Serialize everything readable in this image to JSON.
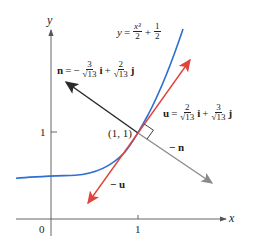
{
  "diagram": {
    "type": "vector-diagram",
    "curve_equation": {
      "lhs": "y",
      "equals": "=",
      "term1_num": "x³",
      "term1_den": "2",
      "plus": "+",
      "term2_num": "1",
      "term2_den": "2"
    },
    "n_label": {
      "name": "n",
      "equals": "=",
      "sign1": "−",
      "c1_num": "3",
      "c1_den": "√13",
      "unit1": "i",
      "plus": "+",
      "c2_num": "2",
      "c2_den": "√13",
      "unit2": "j"
    },
    "u_label": {
      "name": "u",
      "equals": "=",
      "c1_num": "2",
      "c1_den": "√13",
      "unit1": "i",
      "plus": "+",
      "c2_num": "3",
      "c2_den": "√13",
      "unit2": "j"
    },
    "neg_n_label": "− n",
    "neg_u_label": "− u",
    "point_label": "(1, 1)",
    "axes": {
      "x_label": "x",
      "y_label": "y",
      "origin_label": "0",
      "x_tick_label": "1",
      "y_tick_label": "1"
    },
    "colors": {
      "curve": "#2f6fd1",
      "u_vector": "#e0443a",
      "n_vector": "#2a2a2a",
      "neg_n_vector": "#8a8a8a",
      "axes": "#555555"
    }
  }
}
